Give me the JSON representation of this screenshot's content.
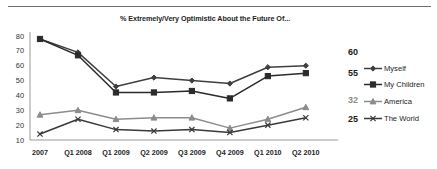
{
  "chart_data": {
    "type": "line",
    "title": "% Extremely/Very Optimistic About the Future Of...",
    "xlabel": "",
    "ylabel": "",
    "ylim": [
      10,
      80
    ],
    "yticks": [
      10,
      20,
      30,
      40,
      50,
      60,
      70,
      80
    ],
    "grid": false,
    "legend_position": "right",
    "categories": [
      "2007",
      "Q1 2008",
      "Q1 2009",
      "Q2 2009",
      "Q3 2009",
      "Q4 2009",
      "Q1 2010",
      "Q2 2010"
    ],
    "series": [
      {
        "name": "Myself",
        "marker": "diamond",
        "color": "#3f3f3f",
        "end_label": "60",
        "end_label_color": "#1a1a1a",
        "values": [
          78,
          69,
          46,
          52,
          50,
          48,
          59,
          60
        ]
      },
      {
        "name": "My Children",
        "marker": "square",
        "color": "#2b2b2b",
        "end_label": "55",
        "end_label_color": "#1a1a1a",
        "values": [
          78,
          67,
          42,
          42,
          43,
          38,
          53,
          55
        ]
      },
      {
        "name": "America",
        "marker": "triangle",
        "color": "#8c8c8c",
        "end_label": "32",
        "end_label_color": "#8c8c8c",
        "values": [
          27,
          30,
          24,
          25,
          25,
          18,
          24,
          32
        ]
      },
      {
        "name": "The World",
        "marker": "cross",
        "color": "#3a3a3a",
        "end_label": "25",
        "end_label_color": "#1a1a1a",
        "values": [
          14,
          24,
          17,
          16,
          17,
          15,
          20,
          25
        ]
      }
    ]
  },
  "legend": {
    "items": [
      {
        "label": "Myself"
      },
      {
        "label": "My Children"
      },
      {
        "label": "America"
      },
      {
        "label": "The World"
      }
    ]
  }
}
